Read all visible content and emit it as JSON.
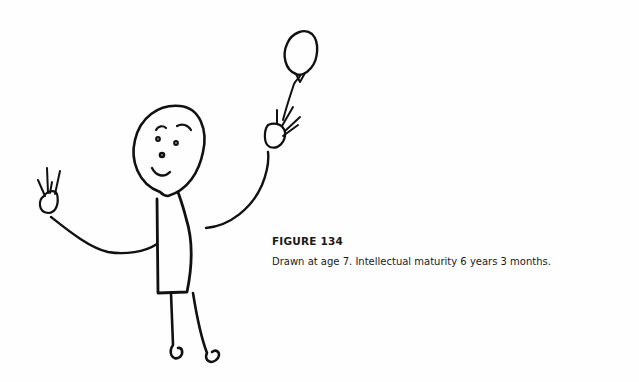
{
  "figure": {
    "label": "FIGURE 134",
    "caption": "Drawn at age 7. Intellectual maturity 6 years 3 months.",
    "drawing_description": "Child's drawing of a stick figure with round face, rectangular body, raised arms with hands, one hand holding a balloon on a string"
  }
}
